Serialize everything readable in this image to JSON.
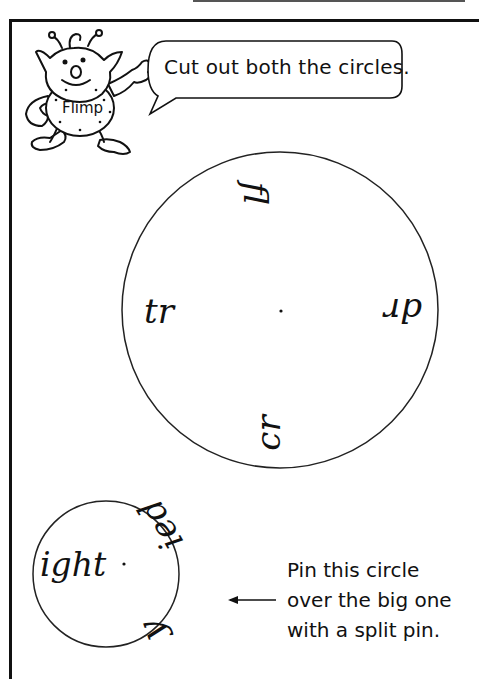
{
  "character": {
    "name": "Flimp",
    "speech": "Cut out both the circles."
  },
  "big_circle": {
    "labels": [
      {
        "text": "fl",
        "position": "top",
        "rotation": 90
      },
      {
        "text": "tr",
        "position": "left",
        "rotation": 0
      },
      {
        "text": "dr",
        "position": "right",
        "rotation": 180
      },
      {
        "text": "cr",
        "position": "bottom",
        "rotation": -90
      }
    ]
  },
  "small_circle": {
    "labels": [
      {
        "text": "ight",
        "position": "left",
        "rotation": 0
      },
      {
        "text": "ied",
        "position": "top-right",
        "rotation": -120
      },
      {
        "text": "y",
        "position": "bottom-right",
        "rotation": -110
      }
    ]
  },
  "instruction": {
    "lines": [
      "Pin this circle",
      "over the big one",
      "with a split pin."
    ]
  }
}
